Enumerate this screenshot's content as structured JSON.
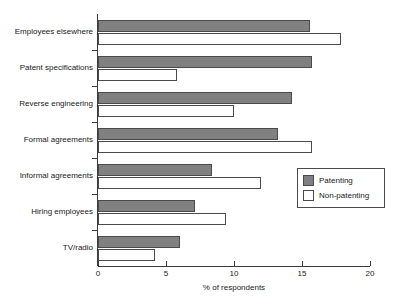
{
  "chart_data": {
    "type": "bar",
    "orientation": "horizontal",
    "title": "",
    "xlabel": "% of respondents",
    "ylabel": "",
    "xlim": [
      0,
      20
    ],
    "xticks": [
      0,
      5,
      10,
      15,
      20
    ],
    "xtick_labels": [
      "0",
      "5",
      "10",
      "15",
      "20"
    ],
    "grid": false,
    "legend_position": "center-right",
    "categories": [
      "Employees elsewhere",
      "Patent specifications",
      "Reverse engineering",
      "Formal agreements",
      "Informal agreements",
      "Hiring employees",
      "TV/radio"
    ],
    "series": [
      {
        "name": "Patenting",
        "color": "#808080",
        "values": [
          15.6,
          15.7,
          14.3,
          13.2,
          8.4,
          7.1,
          6.0
        ]
      },
      {
        "name": "Non-patenting",
        "color": "#ffffff",
        "values": [
          17.9,
          5.8,
          10.0,
          15.7,
          12.0,
          9.4,
          4.2
        ]
      }
    ]
  },
  "legend": {
    "items": [
      {
        "label": "Patenting",
        "swatch": "patenting"
      },
      {
        "label": "Non-patenting",
        "swatch": "nonpatenting"
      }
    ]
  },
  "colors": {
    "patenting": "#808080",
    "nonpatenting": "#ffffff",
    "axis": "#3a3a3a",
    "outline": "#4a4a4a",
    "background": "#ffffff"
  }
}
